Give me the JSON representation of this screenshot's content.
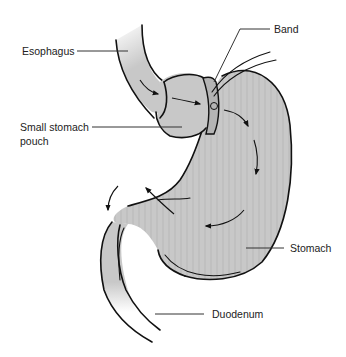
{
  "diagram": {
    "colors": {
      "tissue_fill": "#c8c8c8",
      "tissue_shade": "#b4b4b4",
      "outline": "#111111",
      "leader_line": "#333333",
      "label_text": "#222222",
      "background": "#ffffff"
    },
    "labels": {
      "esophagus": "Esophagus",
      "band": "Band",
      "pouch_line1": "Small stomach",
      "pouch_line2": "pouch",
      "stomach": "Stomach",
      "duodenum": "Duodenum"
    },
    "flow_arrows": {
      "description": "Arrows indicate food flow from esophagus through pouch past the band into the stomach and on to the duodenum",
      "count": 7
    }
  }
}
